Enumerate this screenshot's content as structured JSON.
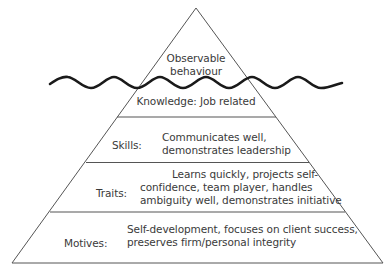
{
  "diagram": {
    "type": "iceberg-pyramid",
    "tip": {
      "line1": "Observable",
      "line2": "behaviour"
    },
    "waterline": "wavy-line",
    "layers": [
      {
        "name": "Knowledge",
        "label": "Knowledge: Job related"
      },
      {
        "name": "Skills",
        "label": "Skills:",
        "text_line1": "Communicates well,",
        "text_line2": "demonstrates leadership"
      },
      {
        "name": "Traits",
        "label": "Traits:",
        "text_line1": "Learns quickly, projects self-",
        "text_line2": "confidence, team player, handles",
        "text_line3": "ambiguity well, demonstrates initiative"
      },
      {
        "name": "Motives",
        "label": "Motives:",
        "text_line1": "Self-development, focuses on client success,",
        "text_line2": "preserves firm/personal integrity"
      }
    ],
    "colors": {
      "line": "#555555",
      "wave": "#1a1a1a",
      "text": "#3a3a3a"
    }
  }
}
